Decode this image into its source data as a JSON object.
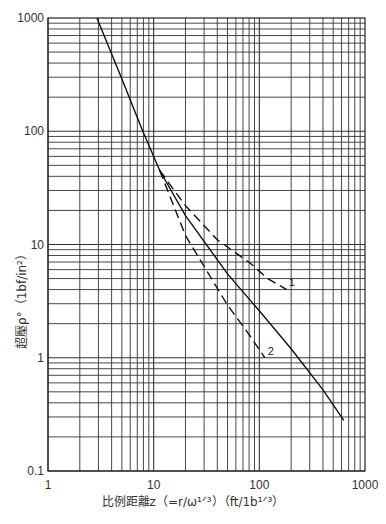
{
  "chart_data": {
    "type": "line",
    "title": "",
    "xlabel": "比例距離z（=r/ω¹ᐟ³）（ft/1b¹ᐟ³）",
    "ylabel": "超壓ρ°（1bf/in²）",
    "xscale": "log",
    "yscale": "log",
    "xlim": [
      1,
      1000
    ],
    "ylim": [
      0.1,
      1000
    ],
    "x_ticks": [
      "1",
      "10",
      "100",
      "1000"
    ],
    "y_ticks": [
      "0.1",
      "1",
      "10",
      "100",
      "1000"
    ],
    "grid": true,
    "legend": null,
    "series": [
      {
        "name": "main",
        "style": "solid",
        "x": [
          2.9,
          5,
          7.9,
          11.4,
          20,
          50,
          100,
          200,
          400,
          630
        ],
        "y": [
          1000,
          290,
          100,
          45,
          18,
          5.5,
          2.6,
          1.2,
          0.52,
          0.28
        ]
      },
      {
        "name": "1",
        "style": "dashed",
        "x": [
          11.4,
          20,
          40,
          81,
          120,
          182
        ],
        "y": [
          45,
          22,
          11,
          6.9,
          5.0,
          4.0
        ]
      },
      {
        "name": "2",
        "style": "dashed",
        "x": [
          11.4,
          20,
          49,
          80,
          113
        ],
        "y": [
          45,
          12,
          3.0,
          1.6,
          1.0
        ]
      }
    ],
    "annotations": [
      {
        "text": "1",
        "x": 190,
        "y": 4.3
      },
      {
        "text": "2",
        "x": 120,
        "y": 1.05
      }
    ]
  }
}
